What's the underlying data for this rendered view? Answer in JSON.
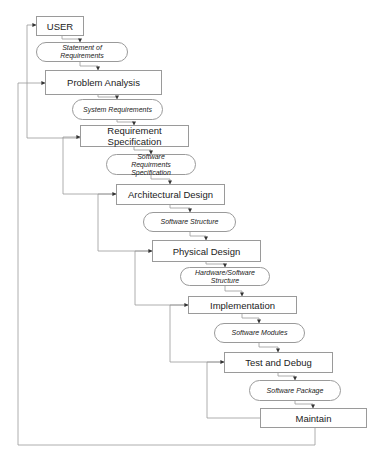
{
  "diagram": {
    "type": "waterfall-flowchart",
    "line_color": "#9a9a9a",
    "stages": [
      {
        "id": "user",
        "label": "USER"
      },
      {
        "id": "problem-analysis",
        "label": "Problem Analysis"
      },
      {
        "id": "requirement-specification",
        "label": "Requirement Specification"
      },
      {
        "id": "architectural-design",
        "label": "Architectural Design"
      },
      {
        "id": "physical-design",
        "label": "Physical Design"
      },
      {
        "id": "implementation",
        "label": "Implementation"
      },
      {
        "id": "test-and-debug",
        "label": "Test and Debug"
      },
      {
        "id": "maintain",
        "label": "Maintain"
      }
    ],
    "artifacts": [
      {
        "id": "statement-of-requirements",
        "label": "Statement of Requirements"
      },
      {
        "id": "system-requirements",
        "label": "System Requirements"
      },
      {
        "id": "software-requirements-specification",
        "label": "Software Requirments Specification"
      },
      {
        "id": "software-structure",
        "label": "Software Structure"
      },
      {
        "id": "hardware-software-structure",
        "label": "Hardware/Software Structure"
      },
      {
        "id": "software-modules",
        "label": "Software Modules"
      },
      {
        "id": "software-package",
        "label": "Software Package"
      }
    ],
    "feedback_edges": [
      {
        "from": "requirement-specification",
        "to": "user"
      },
      {
        "from": "maintain",
        "to": "problem-analysis"
      },
      {
        "from": "architectural-design",
        "to": "requirement-specification"
      },
      {
        "from": "physical-design",
        "to": "architectural-design"
      },
      {
        "from": "implementation",
        "to": "physical-design"
      },
      {
        "from": "test-and-debug",
        "to": "implementation"
      },
      {
        "from": "maintain",
        "to": "test-and-debug"
      }
    ]
  }
}
